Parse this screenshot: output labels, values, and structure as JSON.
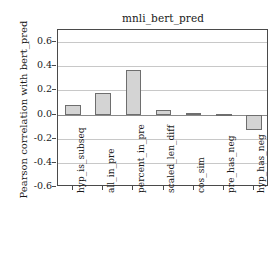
{
  "chart_data": {
    "type": "bar",
    "title": "mnli_bert_pred",
    "xlabel": "",
    "ylabel": "Pearson correlation with bert_pred",
    "categories": [
      "hyp_is_subseq",
      "all_in_pre",
      "percent_in_pre",
      "scaled_len_diff",
      "cos_sim",
      "pre_has_neg",
      "hyp_has_neg"
    ],
    "values": [
      0.075,
      0.175,
      0.37,
      0.04,
      0.012,
      0.008,
      -0.125
    ],
    "ylim": [
      -0.6,
      0.7
    ],
    "yticks": [
      0.6,
      0.4,
      0.2,
      0.0,
      -0.2,
      -0.4,
      -0.6
    ],
    "ytick_labels": [
      "0.6",
      "0.4",
      "0.2",
      "0.0",
      "-0.2",
      "-0.4",
      "-0.6"
    ],
    "grid": true,
    "legend": "none",
    "bar_color": "#d4d4d4",
    "bar_edge_color": "#6e6e6e",
    "grid_color": "#c8c8c8",
    "axis_color": "#4a4a4a",
    "background": "#ffffff"
  }
}
